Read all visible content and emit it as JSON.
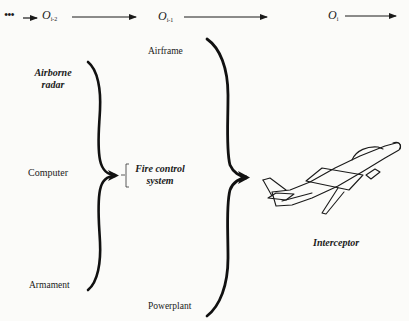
{
  "timeline": {
    "leading_dots": "•••",
    "stages": [
      {
        "base": "O",
        "subscript": "i-2"
      },
      {
        "base": "O",
        "subscript": "i-1"
      },
      {
        "base": "O",
        "subscript": "i"
      }
    ]
  },
  "subsystems_level_1": {
    "components": [
      {
        "label": "Airborne radar",
        "line1": "Airborne",
        "line2": "radar",
        "style": "italic"
      },
      {
        "label": "Computer",
        "style": "roman"
      },
      {
        "label": "Armament",
        "style": "roman"
      }
    ],
    "result": {
      "line1": "Fire control",
      "line2": "system",
      "style": "italic"
    }
  },
  "subsystems_level_2": {
    "components": [
      {
        "label": "Airframe"
      },
      {
        "label": "Fire control system"
      },
      {
        "label": "Powerplant"
      }
    ],
    "result": {
      "label": "Interceptor",
      "style": "italic",
      "icon": "jet-aircraft-icon"
    }
  },
  "colors": {
    "background": "#fbfbf9",
    "ink": "#1a1a1a"
  }
}
